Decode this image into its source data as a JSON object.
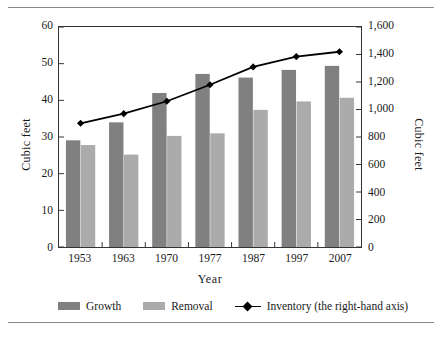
{
  "chart_data": {
    "type": "bar",
    "title": "",
    "xlabel": "Year",
    "ylabel": "Cubic feet",
    "ylabel_right": "Cubic feet",
    "categories": [
      "1953",
      "1963",
      "1970",
      "1977",
      "1987",
      "1997",
      "2007"
    ],
    "ylim": [
      0,
      60
    ],
    "ylim_right": [
      0,
      1600
    ],
    "yticks": [
      "60",
      "50",
      "40",
      "30",
      "20",
      "10",
      "0"
    ],
    "ytick_values": [
      60,
      50,
      40,
      30,
      20,
      10,
      0
    ],
    "yticks_right": [
      "1,600",
      "1,400",
      "1,200",
      "1,000",
      "800",
      "600",
      "400",
      "200",
      "0"
    ],
    "ytick_values_right": [
      1600,
      1400,
      1200,
      1000,
      800,
      600,
      400,
      200,
      0
    ],
    "grid": false,
    "legend_position": "bottom",
    "series": [
      {
        "name": "Growth",
        "type": "bar",
        "axis": "left",
        "color": "#808080",
        "values": [
          29.1,
          34.0,
          42.0,
          47.2,
          46.2,
          48.3,
          49.4
        ]
      },
      {
        "name": "Removal",
        "type": "bar",
        "axis": "left",
        "color": "#ababab",
        "values": [
          27.8,
          25.2,
          30.3,
          31.0,
          37.4,
          39.7,
          40.7
        ]
      },
      {
        "name": "Inventory (the right-hand axis)",
        "type": "line",
        "axis": "right",
        "color": "#000000",
        "values": [
          900,
          970,
          1060,
          1180,
          1310,
          1385,
          1420
        ]
      }
    ]
  },
  "legend": {
    "items": [
      {
        "label": "Growth",
        "marker": "swatch-dark"
      },
      {
        "label": "Removal",
        "marker": "swatch-light"
      },
      {
        "label": "Inventory (the right-hand axis)",
        "marker": "line-diamond"
      }
    ]
  },
  "colors": {
    "growth": "#808080",
    "removal": "#ababab",
    "inventory": "#000000",
    "axis": "#333333",
    "rule": "#8a8a8a"
  }
}
